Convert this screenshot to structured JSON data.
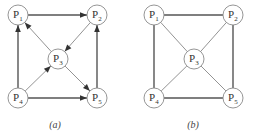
{
  "diagrams": [
    {
      "id": "a",
      "caption": "(a)",
      "directed": true,
      "nodes": [
        {
          "id": "P1",
          "base": "P",
          "sub": "1",
          "x": 18,
          "y": 15
        },
        {
          "id": "P2",
          "base": "P",
          "sub": "2",
          "x": 97,
          "y": 15
        },
        {
          "id": "P3",
          "base": "P",
          "sub": "3",
          "x": 58,
          "y": 59
        },
        {
          "id": "P4",
          "base": "P",
          "sub": "4",
          "x": 18,
          "y": 98
        },
        {
          "id": "P5",
          "base": "P",
          "sub": "5",
          "x": 97,
          "y": 98
        }
      ],
      "edges": [
        {
          "from": "P1",
          "to": "P2",
          "style": "thick"
        },
        {
          "from": "P4",
          "to": "P1",
          "style": "thick"
        },
        {
          "from": "P4",
          "to": "P5",
          "style": "thick"
        },
        {
          "from": "P5",
          "to": "P2",
          "style": "thick"
        },
        {
          "from": "P3",
          "to": "P1",
          "style": "thin"
        },
        {
          "from": "P2",
          "to": "P3",
          "style": "thin"
        },
        {
          "from": "P4",
          "to": "P3",
          "style": "thin"
        },
        {
          "from": "P3",
          "to": "P5",
          "style": "thin"
        }
      ]
    },
    {
      "id": "b",
      "caption": "(b)",
      "directed": false,
      "nodes": [
        {
          "id": "P1",
          "base": "P",
          "sub": "1",
          "x": 154,
          "y": 15
        },
        {
          "id": "P2",
          "base": "P",
          "sub": "2",
          "x": 233,
          "y": 15
        },
        {
          "id": "P3",
          "base": "P",
          "sub": "3",
          "x": 194,
          "y": 59
        },
        {
          "id": "P4",
          "base": "P",
          "sub": "4",
          "x": 154,
          "y": 98
        },
        {
          "id": "P5",
          "base": "P",
          "sub": "5",
          "x": 233,
          "y": 98
        }
      ],
      "edges": [
        {
          "from": "P1",
          "to": "P2",
          "style": "thick"
        },
        {
          "from": "P1",
          "to": "P4",
          "style": "thick"
        },
        {
          "from": "P4",
          "to": "P5",
          "style": "thick"
        },
        {
          "from": "P2",
          "to": "P5",
          "style": "thick"
        },
        {
          "from": "P1",
          "to": "P3",
          "style": "thin"
        },
        {
          "from": "P2",
          "to": "P3",
          "style": "thin"
        },
        {
          "from": "P4",
          "to": "P3",
          "style": "thin"
        },
        {
          "from": "P5",
          "to": "P3",
          "style": "thin"
        }
      ]
    }
  ],
  "captions": {
    "a": "(a)",
    "b": "(b)"
  },
  "node_radius": 10
}
